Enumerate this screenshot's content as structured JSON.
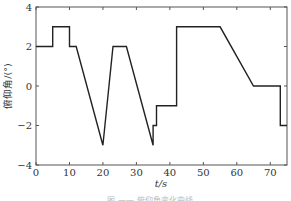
{
  "chart_data": {
    "type": "line",
    "title": "",
    "xlabel": "t/s",
    "ylabel": "俯仰角/(°)",
    "xlim": [
      0,
      75
    ],
    "ylim": [
      -4,
      4
    ],
    "xticks": [
      0,
      10,
      20,
      30,
      40,
      50,
      60,
      70
    ],
    "yticks": [
      -4,
      -2,
      0,
      2,
      4
    ],
    "xtick_labels": [
      "0",
      "10",
      "20",
      "30",
      "40",
      "50",
      "60",
      "70"
    ],
    "ytick_labels": [
      "−4",
      "−2",
      "0",
      "2",
      "4"
    ],
    "grid": false,
    "legend": null,
    "series": [
      {
        "name": "pitch angle",
        "color": "#222222",
        "x": [
          0,
          5,
          5,
          10,
          10,
          12,
          20,
          23,
          27,
          35,
          35,
          36,
          36,
          42,
          42,
          55,
          65,
          73,
          73,
          75
        ],
        "y": [
          2,
          2,
          3,
          3,
          2,
          2,
          -3,
          2,
          2,
          -3,
          -2,
          -2,
          -1,
          -1,
          3,
          3,
          0,
          0,
          -2,
          -2
        ]
      }
    ]
  },
  "caption": "图 —— 俯仰角变化曲线"
}
